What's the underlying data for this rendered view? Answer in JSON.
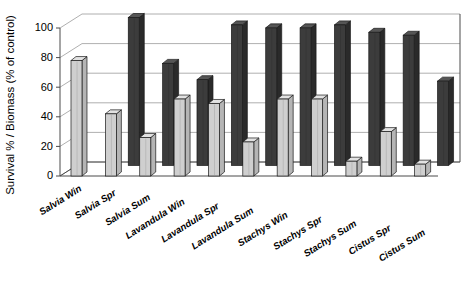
{
  "chart_data": {
    "type": "bar",
    "title": "",
    "subtitle": "",
    "xlabel": "",
    "ylabel": "Survival % / Biomass (% of control)",
    "ylim": [
      0,
      100
    ],
    "ytick_labels": [
      "0",
      "20",
      "40",
      "60",
      "80",
      "100"
    ],
    "ytick_values": [
      0,
      20,
      40,
      60,
      80,
      100
    ],
    "grid": true,
    "legend_position": "none",
    "projection": "3d-columns",
    "categories": [
      "Salvia Win",
      "Salvia Spr",
      "Salvia Sum",
      "Lavandula Win",
      "Lavandula Spr",
      "Lavandula Sum",
      "Stachys Win",
      "Stachys Spr",
      "Stachys Sum",
      "Cistus Spr",
      "Cistus Sum"
    ],
    "series": [
      {
        "name": "Survival %",
        "color": "#cfcfcf",
        "values": [
          78,
          42,
          26,
          52,
          49,
          23,
          52,
          52,
          10,
          30,
          8
        ]
      },
      {
        "name": "Biomass (% of control)",
        "color": "#3c3c3c",
        "values": [
          0,
          100,
          69,
          58,
          95,
          93,
          93,
          95,
          90,
          88,
          57
        ]
      }
    ]
  },
  "axes": {
    "y_title": "Survival % / Biomass (% of control)"
  },
  "colors": {
    "light_bar_face": "#cfcfcf",
    "light_bar_side": "#b5b5b5",
    "light_bar_top": "#e2e2e2",
    "dark_bar_face": "#3c3c3c",
    "dark_bar_side": "#2a2a2a",
    "dark_bar_top": "#555555",
    "axis": "#4a4a4a",
    "grid": "#9a9a9a",
    "background": "#ffffff"
  }
}
